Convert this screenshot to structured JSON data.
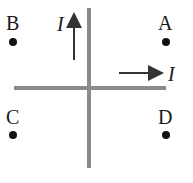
{
  "diagram": {
    "type": "crossed current-carrying wires",
    "wires": [
      {
        "id": "vertical",
        "current_label": "I",
        "direction": "up",
        "color": "#8a8a8a"
      },
      {
        "id": "horizontal",
        "current_label": "I",
        "direction": "right",
        "color": "#8a8a8a"
      }
    ],
    "points": [
      {
        "label": "A",
        "quadrant": "upper-right"
      },
      {
        "label": "B",
        "quadrant": "upper-left"
      },
      {
        "label": "C",
        "quadrant": "lower-left"
      },
      {
        "label": "D",
        "quadrant": "lower-right"
      }
    ],
    "arrow_color": "#333333",
    "point_color": "#111111"
  }
}
